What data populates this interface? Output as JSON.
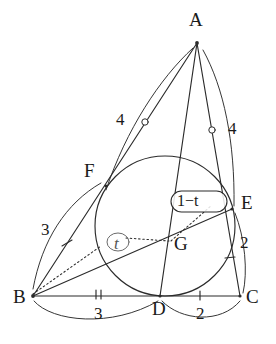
{
  "figure": {
    "kind": "geometry-diagram",
    "stroke_color": "#2b2b2b",
    "label_color": "#1a1a1a",
    "background": "#ffffff"
  },
  "vertices": [
    {
      "name": "A",
      "label": "A",
      "x": 197,
      "y": 43,
      "label_x": 189,
      "label_y": 10
    },
    {
      "name": "B",
      "label": "B",
      "x": 33,
      "y": 296,
      "label_x": 13,
      "label_y": 297
    },
    {
      "name": "C",
      "label": "C",
      "x": 240,
      "y": 296,
      "label_x": 246,
      "label_y": 297
    },
    {
      "name": "D",
      "label": "D",
      "x": 160,
      "y": 296,
      "label_x": 152,
      "label_y": 304
    },
    {
      "name": "E",
      "label": "E",
      "x": 232,
      "y": 209,
      "label_x": 241,
      "label_y": 196
    },
    {
      "name": "F",
      "label": "F",
      "x": 106,
      "y": 186,
      "label_x": 84,
      "label_y": 163
    },
    {
      "name": "G",
      "label": "G",
      "x": 171,
      "y": 241,
      "label_x": 174,
      "label_y": 240
    }
  ],
  "incircle": {
    "cx": 165,
    "cy": 226,
    "r": 70
  },
  "segments": [
    {
      "name": "side-BC",
      "from": "B",
      "to": "C"
    },
    {
      "name": "side-AB",
      "from": "A",
      "to": "B"
    },
    {
      "name": "side-AC",
      "from": "A",
      "to": "C"
    },
    {
      "name": "cevian-AD",
      "from": "A",
      "to": "D"
    },
    {
      "name": "cevian-BE",
      "from": "B",
      "to": "E"
    }
  ],
  "dotted": [
    {
      "name": "dotted-B-to-t-oval"
    },
    {
      "name": "dotted-t-to-G"
    },
    {
      "name": "dotted-G-to-E"
    }
  ],
  "measure_labels": [
    {
      "name": "measure-AF",
      "text": "4",
      "x": 116,
      "y": 111,
      "arc": "A-to-F"
    },
    {
      "name": "measure-AE",
      "text": "4",
      "x": 228,
      "y": 120,
      "arc": "A-to-E"
    },
    {
      "name": "measure-BF",
      "text": "3",
      "x": 41,
      "y": 221,
      "arc": "B-to-F"
    },
    {
      "name": "measure-BD",
      "text": "3",
      "x": 94,
      "y": 309,
      "arc": "B-to-D"
    },
    {
      "name": "measure-DC",
      "text": "2",
      "x": 196,
      "y": 309,
      "arc": "D-to-C"
    },
    {
      "name": "measure-EC",
      "text": "2",
      "x": 240,
      "y": 239,
      "arc": "E-to-C"
    }
  ],
  "ratio_labels": [
    {
      "name": "ratio-t",
      "text": "t",
      "x": 112,
      "y": 234,
      "boxed": true
    },
    {
      "name": "ratio-one-minus-t",
      "text": "1−t",
      "x": 176,
      "y": 192,
      "boxed": true
    }
  ],
  "tick_marks": [
    {
      "name": "tick-AF-circle",
      "kind": "circle",
      "x": 145,
      "y": 122
    },
    {
      "name": "tick-AE-circle",
      "kind": "circle",
      "x": 212,
      "y": 130
    },
    {
      "name": "tick-BF-single",
      "kind": "single",
      "x": 67,
      "y": 243
    },
    {
      "name": "tick-EC-single",
      "kind": "single",
      "x": 230,
      "y": 258
    },
    {
      "name": "tick-BD-double",
      "kind": "double",
      "x": 98,
      "y": 296
    },
    {
      "name": "tick-DC-single",
      "kind": "single",
      "x": 200,
      "y": 296
    }
  ]
}
